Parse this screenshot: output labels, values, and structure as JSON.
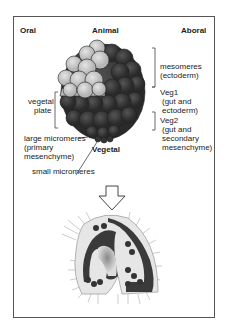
{
  "headers": {
    "oral": "Oral",
    "animal": "Animal",
    "aboral": "Aboral"
  },
  "labels": {
    "mesomeres": "mesomeres",
    "mesomeres_sub": "(ectoderm)",
    "veg1": "Veg1",
    "veg1_sub1": "(gut and",
    "veg1_sub2": "ectoderm)",
    "veg2": "Veg2",
    "veg2_sub1": "(gut and",
    "veg2_sub2": "secondary",
    "veg2_sub3": "mesenchyme)",
    "vegetal_plate1": "vegetal",
    "vegetal_plate2": "plate",
    "large_micro1": "large micromeres",
    "large_micro2": "(primary",
    "large_micro3": "mesenchyme)",
    "vegetal": "Vegetal",
    "small_micro": "small micromeres"
  },
  "colors": {
    "light": "#cfcfcf",
    "dark": "#3a3a3a",
    "mid": "#7a7a7a"
  }
}
